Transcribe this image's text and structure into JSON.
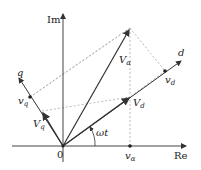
{
  "diagram": {
    "title": "",
    "type": "phasor diagram",
    "colors": {
      "axis": "#444444",
      "vector": "#333333",
      "dashed": "#aaaaaa",
      "label": "#222222"
    },
    "axes": {
      "real": {
        "label": "Re"
      },
      "imag": {
        "label": "Im"
      },
      "origin_label": "0"
    },
    "rotating_axes": {
      "d": {
        "label": "d"
      },
      "q": {
        "label": "q"
      },
      "angle_label": "ωt"
    },
    "vectors": {
      "v_alpha": {
        "label_main": "V",
        "label_sub": "α"
      },
      "V_d": {
        "label_main": "V",
        "label_sub": "d"
      },
      "V_q": {
        "label_main": "V",
        "label_sub": "q"
      }
    },
    "projections": {
      "v_alpha": {
        "label_main": "v",
        "label_sub": "α"
      },
      "v_d": {
        "label_main": "v",
        "label_sub": "d"
      },
      "v_q": {
        "label_main": "v",
        "label_sub": "q"
      }
    }
  }
}
